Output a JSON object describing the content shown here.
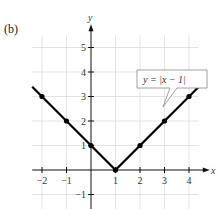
{
  "panel_label": "(b)",
  "chart_data": {
    "type": "line",
    "title": "",
    "equation_label": "y = |x − 1|",
    "xlabel": "x",
    "ylabel": "y",
    "xlim": [
      -2.4,
      4.7
    ],
    "ylim": [
      -1.4,
      5.8
    ],
    "x_ticks": [
      -2,
      -1,
      1,
      2,
      3,
      4
    ],
    "x_tick_labels": [
      "−2",
      "−1",
      "1",
      "2",
      "3",
      "4"
    ],
    "y_ticks": [
      -1,
      1,
      2,
      3,
      4,
      5
    ],
    "y_tick_labels": [
      "−1",
      "1",
      "2",
      "3",
      "4",
      "5"
    ],
    "grid": true,
    "series": [
      {
        "name": "y = |x - 1|",
        "x": [
          -2.4,
          1,
          4.4
        ],
        "y": [
          3.4,
          0,
          3.4
        ]
      }
    ],
    "points": {
      "x": [
        -2,
        -1,
        0,
        1,
        2,
        3,
        4
      ],
      "y": [
        3,
        2,
        1,
        0,
        1,
        2,
        3
      ]
    }
  },
  "colors": {
    "grid": "#d9d9d9",
    "axis": "#111111",
    "line": "#000000"
  }
}
